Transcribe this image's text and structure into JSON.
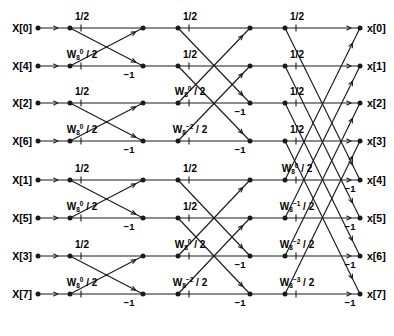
{
  "figure": {
    "stroke_color": "#1a1a1a",
    "background_color": "#ffffff"
  },
  "inputs": [
    {
      "label": "X[0]",
      "row": 0
    },
    {
      "label": "X[4]",
      "row": 1
    },
    {
      "label": "X[2]",
      "row": 2
    },
    {
      "label": "X[6]",
      "row": 3
    },
    {
      "label": "X[1]",
      "row": 4
    },
    {
      "label": "X[5]",
      "row": 5
    },
    {
      "label": "X[3]",
      "row": 6
    },
    {
      "label": "X[7]",
      "row": 7
    }
  ],
  "outputs": [
    {
      "label": "x[0]",
      "row": 0
    },
    {
      "label": "x[1]",
      "row": 1
    },
    {
      "label": "x[2]",
      "row": 2
    },
    {
      "label": "x[3]",
      "row": 3
    },
    {
      "label": "x[4]",
      "row": 4
    },
    {
      "label": "x[5]",
      "row": 5
    },
    {
      "label": "x[6]",
      "row": 6
    },
    {
      "label": "x[7]",
      "row": 7
    }
  ],
  "stage1_coefficients": [
    {
      "row": 0,
      "text": "1/2",
      "w": false
    },
    {
      "row": 1,
      "text": "W_8^0 / 2",
      "w": true,
      "exp": "0"
    },
    {
      "row": 2,
      "text": "1/2",
      "w": false
    },
    {
      "row": 3,
      "text": "W_8^0 / 2",
      "w": true,
      "exp": "0"
    },
    {
      "row": 4,
      "text": "1/2",
      "w": false
    },
    {
      "row": 5,
      "text": "W_8^0 / 2",
      "w": true,
      "exp": "0"
    },
    {
      "row": 6,
      "text": "1/2",
      "w": false
    },
    {
      "row": 7,
      "text": "W_8^0 / 2",
      "w": true,
      "exp": "0"
    }
  ],
  "stage2_coefficients": [
    {
      "row": 0,
      "text": "1/2",
      "w": false
    },
    {
      "row": 1,
      "text": "1/2",
      "w": false
    },
    {
      "row": 2,
      "text": "W_8^0 / 2",
      "w": true,
      "exp": "0"
    },
    {
      "row": 3,
      "text": "W_8^-2 / 2",
      "w": true,
      "exp": "-2"
    },
    {
      "row": 4,
      "text": "1/2",
      "w": false
    },
    {
      "row": 5,
      "text": "1/2",
      "w": false
    },
    {
      "row": 6,
      "text": "W_8^0 / 2",
      "w": true,
      "exp": "0"
    },
    {
      "row": 7,
      "text": "W_8^-2 / 2",
      "w": true,
      "exp": "-2"
    }
  ],
  "stage3_coefficients": [
    {
      "row": 0,
      "text": "1/2",
      "w": false
    },
    {
      "row": 1,
      "text": "1/2",
      "w": false
    },
    {
      "row": 2,
      "text": "1/2",
      "w": false
    },
    {
      "row": 3,
      "text": "1/2",
      "w": false
    },
    {
      "row": 4,
      "text": "W_8^0 / 2",
      "w": true,
      "exp": "0"
    },
    {
      "row": 5,
      "text": "W_8^-1 / 2",
      "w": true,
      "exp": "-1"
    },
    {
      "row": 6,
      "text": "W_8^-2 / 2",
      "w": true,
      "exp": "-2"
    },
    {
      "row": 7,
      "text": "W_8^-3 / 2",
      "w": true,
      "exp": "-3"
    }
  ],
  "negative_one_labels": [
    {
      "text": "-1",
      "stage": 1,
      "row": 1
    },
    {
      "text": "-1",
      "stage": 1,
      "row": 3
    },
    {
      "text": "-1",
      "stage": 1,
      "row": 5
    },
    {
      "text": "-1",
      "stage": 1,
      "row": 7
    },
    {
      "text": "-1",
      "stage": 2,
      "row": 2
    },
    {
      "text": "-1",
      "stage": 2,
      "row": 3
    },
    {
      "text": "-1",
      "stage": 2,
      "row": 6
    },
    {
      "text": "-1",
      "stage": 2,
      "row": 7
    },
    {
      "text": "-1",
      "stage": 3,
      "row": 4
    },
    {
      "text": "-1",
      "stage": 3,
      "row": 5
    },
    {
      "text": "-1",
      "stage": 3,
      "row": 6
    },
    {
      "text": "-1",
      "stage": 3,
      "row": 7
    }
  ],
  "geometry": {
    "rows_y": [
      28,
      66,
      103,
      141,
      180,
      218,
      256,
      294
    ],
    "node_x": [
      38,
      70,
      143,
      178,
      250,
      285,
      360
    ],
    "stage_spans": [
      1,
      2,
      4
    ],
    "num_points": 8,
    "num_stages": 3
  },
  "symbols": {
    "w_base": "W",
    "w_sub": "8",
    "divide_by_two": "/ 2",
    "half": "1/2",
    "minus_one": "−1"
  }
}
